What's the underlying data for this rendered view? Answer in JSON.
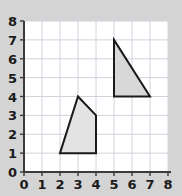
{
  "chart_data": {
    "type": "scatter",
    "title": "",
    "xlabel": "",
    "ylabel": "",
    "xlim": [
      0,
      8
    ],
    "ylim": [
      0,
      8
    ],
    "grid": true,
    "legend": false,
    "x_ticks": [
      "0",
      "1",
      "2",
      "3",
      "4",
      "5",
      "6",
      "7",
      "8"
    ],
    "y_ticks": [
      "0",
      "1",
      "2",
      "3",
      "4",
      "5",
      "6",
      "7",
      "8"
    ],
    "x_tick_values": [
      0,
      1,
      2,
      3,
      4,
      5,
      6,
      7,
      8
    ],
    "y_tick_values": [
      0,
      1,
      2,
      3,
      4,
      5,
      6,
      7,
      8
    ],
    "shapes": [
      {
        "name": "pentagon-quadrilateral",
        "kind": "polygon",
        "vertices": [
          [
            2,
            1
          ],
          [
            3,
            4
          ],
          [
            4,
            3
          ],
          [
            4,
            1
          ]
        ],
        "fill": "#e3e3e3",
        "stroke": "#1a1a1a",
        "stroke_width": 2
      },
      {
        "name": "right-triangle",
        "kind": "polygon",
        "vertices": [
          [
            5,
            7
          ],
          [
            7,
            4
          ],
          [
            5,
            4
          ]
        ],
        "fill": "#d8d8d8",
        "stroke": "#1a1a1a",
        "stroke_width": 2
      }
    ]
  },
  "style": {
    "page_background": "#d4d4d4",
    "plot_background": "#ffffff",
    "grid_color": "#cfd4dd",
    "axis_color": "#3a3a3a",
    "tick_color": "#3a3a3a",
    "label_color": "#1a1a1a"
  },
  "geometry": {
    "plot_left": 24,
    "plot_top": 21,
    "plot_right": 168,
    "plot_bottom": 172,
    "unit_px_x": 18,
    "unit_px_y": 18.875
  }
}
